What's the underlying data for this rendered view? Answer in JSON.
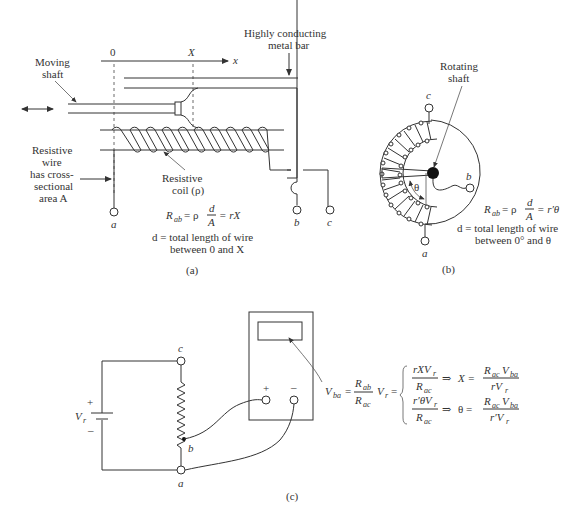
{
  "figure": {
    "panel_a": {
      "caption": "(a)",
      "labels": {
        "moving_shaft_1": "Moving",
        "moving_shaft_2": "shaft",
        "axis_zero": "0",
        "axis_X": "X",
        "axis_x": "x",
        "metal_bar_1": "Highly conducting",
        "metal_bar_2": "metal bar",
        "resistive_wire_1": "Resistive",
        "resistive_wire_2": "wire",
        "resistive_wire_3": "has cross-",
        "resistive_wire_4": "sectional",
        "resistive_wire_5": "area A",
        "coil_1": "Resistive",
        "coil_2": "coil (ρ)",
        "terminal_a": "a",
        "terminal_b": "b",
        "terminal_c": "c"
      },
      "equation": {
        "lhs": "R",
        "lhs_sub": "ab",
        "eq1": "= ρ",
        "frac_num": "d",
        "frac_den": "A",
        "eq2": "= rX"
      },
      "note_1": "d = total length of wire",
      "note_2": "between 0 and X"
    },
    "panel_b": {
      "caption": "(b)",
      "labels": {
        "rotating_shaft_1": "Rotating",
        "rotating_shaft_2": "shaft",
        "theta": "θ",
        "terminal_a": "a",
        "terminal_b": "b",
        "terminal_c": "c"
      },
      "equation": {
        "lhs": "R",
        "lhs_sub": "ab",
        "eq1": "= ρ",
        "frac_num": "d",
        "frac_den": "A",
        "eq2": "= r′θ"
      },
      "note_1": "d = total length of wire",
      "note_2": "between 0° and θ"
    },
    "panel_c": {
      "caption": "(c)",
      "labels": {
        "source": "V",
        "source_sub": "r",
        "plus": "+",
        "minus": "–",
        "terminal_a": "a",
        "terminal_b": "b",
        "terminal_c": "c",
        "meter_plus": "+",
        "meter_minus": "–"
      },
      "equation": {
        "vba": "V",
        "vba_sub": "ba",
        "eq": "=",
        "rab": "R",
        "rab_sub": "ab",
        "rac": "R",
        "rac_sub": "ac",
        "vr": "V",
        "vr_sub": "r",
        "eq2": "=",
        "case1_num": "rXV",
        "case1_num_sub": "r",
        "case1_den": "R",
        "case1_den_sub": "ac",
        "implies": "⇒",
        "case1_var": "X =",
        "case1_res_num": "R",
        "case1_res_num_sub": "ac",
        "case1_res_num2": "V",
        "case1_res_num2_sub": "ba",
        "case1_res_den": "rV",
        "case1_res_den_sub": "r",
        "case2_num": "r′θV",
        "case2_num_sub": "r",
        "case2_den": "R",
        "case2_den_sub": "ac",
        "case2_var": "θ =",
        "case2_res_num": "R",
        "case2_res_num_sub": "ac",
        "case2_res_num2": "V",
        "case2_res_num2_sub": "ba",
        "case2_res_den": "r′V",
        "case2_res_den_sub": "r"
      }
    }
  }
}
